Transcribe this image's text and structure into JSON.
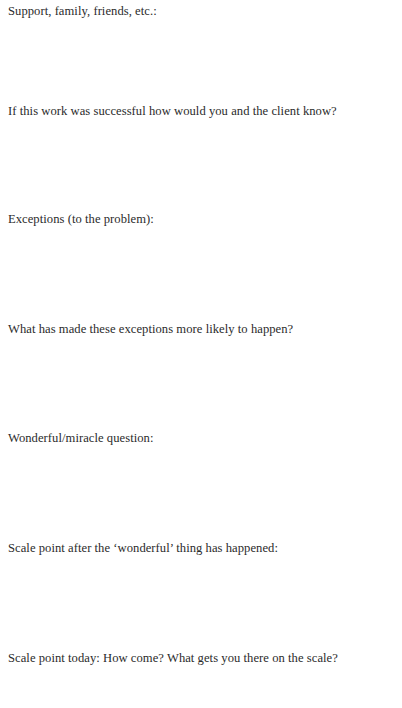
{
  "worksheet": {
    "prompts": [
      {
        "label": "Support, family, friends, etc.:",
        "top": 3
      },
      {
        "label": "If this work was successful how would you and the client know?",
        "top": 103
      },
      {
        "label": "Exceptions (to the problem):",
        "top": 211
      },
      {
        "label": "What has made these exceptions more likely to happen?",
        "top": 321
      },
      {
        "label": "Wonderful/miracle question:",
        "top": 430
      },
      {
        "label": "Scale point after the ‘wonderful’ thing has happened:",
        "top": 540
      },
      {
        "label": "Scale point today: How come? What gets you there on the scale?",
        "top": 650
      }
    ]
  }
}
